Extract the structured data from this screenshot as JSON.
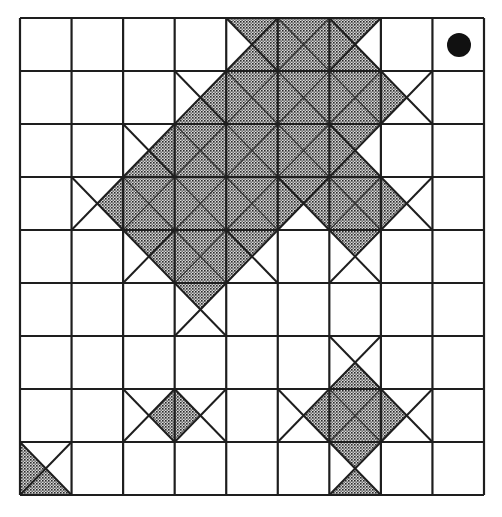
{
  "diagram": {
    "type": "grid-tiling",
    "rows": 9,
    "cols": 9,
    "grid_origin": [
      20,
      18
    ],
    "grid_size": [
      464,
      477
    ],
    "colors": {
      "line": "#1e1e1e",
      "shade_fg": "#2a2a2a",
      "shade_bg": "#d8d8d8",
      "background": "#ffffff",
      "marker": "#111111"
    },
    "triangle_order": [
      "top",
      "right",
      "bottom",
      "left"
    ],
    "cells": [
      {
        "row": 0,
        "col": 4,
        "shade": [
          1,
          1,
          1,
          0
        ]
      },
      {
        "row": 0,
        "col": 5,
        "shade": [
          1,
          1,
          1,
          1
        ]
      },
      {
        "row": 0,
        "col": 6,
        "shade": [
          1,
          0,
          1,
          1
        ]
      },
      {
        "row": 1,
        "col": 3,
        "shade": [
          0,
          1,
          1,
          0
        ]
      },
      {
        "row": 1,
        "col": 4,
        "shade": [
          1,
          1,
          1,
          1
        ]
      },
      {
        "row": 1,
        "col": 5,
        "shade": [
          1,
          1,
          1,
          1
        ]
      },
      {
        "row": 1,
        "col": 6,
        "shade": [
          1,
          1,
          1,
          1
        ]
      },
      {
        "row": 1,
        "col": 7,
        "shade": [
          0,
          0,
          0,
          1
        ]
      },
      {
        "row": 2,
        "col": 2,
        "shade": [
          0,
          1,
          1,
          0
        ]
      },
      {
        "row": 2,
        "col": 3,
        "shade": [
          1,
          1,
          1,
          1
        ]
      },
      {
        "row": 2,
        "col": 4,
        "shade": [
          1,
          1,
          1,
          1
        ]
      },
      {
        "row": 2,
        "col": 5,
        "shade": [
          1,
          1,
          1,
          1
        ]
      },
      {
        "row": 2,
        "col": 6,
        "shade": [
          1,
          0,
          1,
          1
        ]
      },
      {
        "row": 3,
        "col": 1,
        "shade": [
          0,
          1,
          0,
          0
        ]
      },
      {
        "row": 3,
        "col": 2,
        "shade": [
          1,
          1,
          1,
          1
        ]
      },
      {
        "row": 3,
        "col": 3,
        "shade": [
          1,
          1,
          1,
          1
        ]
      },
      {
        "row": 3,
        "col": 4,
        "shade": [
          1,
          1,
          1,
          1
        ]
      },
      {
        "row": 3,
        "col": 5,
        "shade": [
          1,
          1,
          0,
          1
        ]
      },
      {
        "row": 3,
        "col": 6,
        "shade": [
          1,
          1,
          1,
          1
        ]
      },
      {
        "row": 3,
        "col": 7,
        "shade": [
          0,
          0,
          0,
          1
        ]
      },
      {
        "row": 4,
        "col": 2,
        "shade": [
          1,
          1,
          0,
          0
        ]
      },
      {
        "row": 4,
        "col": 3,
        "shade": [
          1,
          1,
          1,
          1
        ]
      },
      {
        "row": 4,
        "col": 4,
        "shade": [
          1,
          0,
          0,
          1
        ]
      },
      {
        "row": 4,
        "col": 6,
        "shade": [
          1,
          0,
          0,
          0
        ]
      },
      {
        "row": 5,
        "col": 3,
        "shade": [
          1,
          0,
          0,
          0
        ]
      },
      {
        "row": 6,
        "col": 6,
        "shade": [
          0,
          0,
          1,
          0
        ]
      },
      {
        "row": 7,
        "col": 2,
        "shade": [
          0,
          1,
          0,
          0
        ]
      },
      {
        "row": 7,
        "col": 3,
        "shade": [
          0,
          0,
          0,
          1
        ]
      },
      {
        "row": 7,
        "col": 5,
        "shade": [
          0,
          1,
          0,
          0
        ]
      },
      {
        "row": 7,
        "col": 6,
        "shade": [
          1,
          1,
          1,
          1
        ]
      },
      {
        "row": 7,
        "col": 7,
        "shade": [
          0,
          0,
          0,
          1
        ]
      },
      {
        "row": 8,
        "col": 0,
        "shade": [
          0,
          0,
          1,
          1
        ]
      },
      {
        "row": 8,
        "col": 6,
        "shade": [
          1,
          0,
          1,
          0
        ]
      }
    ],
    "markers": [
      {
        "row": 0,
        "col": 8,
        "kind": "filled-circle",
        "icon": "black-dot-icon",
        "center": [
          459,
          45
        ],
        "radius": 12
      }
    ]
  }
}
